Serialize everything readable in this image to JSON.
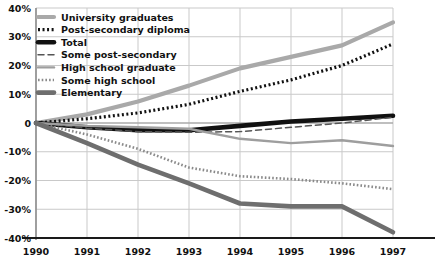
{
  "chart_data": {
    "type": "line",
    "title": "",
    "subtitle": "",
    "xlabel": "",
    "ylabel": "",
    "x": [
      1990,
      1991,
      1992,
      1993,
      1994,
      1995,
      1996,
      1997
    ],
    "xtick_labels": [
      "1990",
      "1991",
      "1992",
      "1993",
      "1994",
      "1995",
      "1996",
      "1997"
    ],
    "ytick_labels": [
      "40%",
      "30%",
      "20%",
      "10%",
      "0",
      "-10%",
      "-20%",
      "-30%",
      "-40%"
    ],
    "ytick_values": [
      40,
      30,
      20,
      10,
      0,
      -10,
      -20,
      -30,
      -40
    ],
    "ylim": [
      -40,
      40
    ],
    "xlim": [
      1990,
      1997
    ],
    "grid": true,
    "legend_position": "top-left",
    "series": [
      {
        "name": "University graduates",
        "values": [
          0,
          3,
          7.5,
          13,
          19,
          23,
          27,
          35
        ],
        "color": "#a9a9a9",
        "style": "solid",
        "width": 4.2
      },
      {
        "name": "Post-secondary diploma",
        "values": [
          0,
          1.5,
          3.5,
          6.5,
          11,
          15,
          20,
          27.5
        ],
        "color": "#111111",
        "style": "dotted",
        "width": 3.2
      },
      {
        "name": "Total",
        "values": [
          0,
          -1.5,
          -2.5,
          -2.5,
          -1,
          0.5,
          1.5,
          2.5
        ],
        "color": "#111111",
        "style": "solid",
        "width": 4.6
      },
      {
        "name": "Some post-secondary",
        "values": [
          0,
          -1.8,
          -3.0,
          -3.2,
          -3.0,
          -1.5,
          0.0,
          2.0
        ],
        "color": "#555555",
        "style": "dashed",
        "width": 1.5
      },
      {
        "name": "High school graduate",
        "values": [
          0,
          -1.0,
          -1.5,
          -2.0,
          -5.5,
          -7.0,
          -6.0,
          -8.0
        ],
        "color": "#9e9e9e",
        "style": "solid",
        "width": 2.4
      },
      {
        "name": "Some high school",
        "values": [
          0,
          -4.0,
          -9.0,
          -15.5,
          -18.5,
          -19.5,
          -21.0,
          -23.0
        ],
        "color": "#8a8a8a",
        "style": "dotted",
        "width": 2.6
      },
      {
        "name": "Elementary",
        "values": [
          0,
          -7.0,
          -14.5,
          -21.0,
          -28.0,
          -29.0,
          -29.0,
          -38.0
        ],
        "color": "#6e6e6e",
        "style": "solid",
        "width": 4.6
      }
    ]
  },
  "legend": {
    "items": [
      {
        "label": "University graduates"
      },
      {
        "label": "Post-secondary diploma"
      },
      {
        "label": "Total"
      },
      {
        "label": "Some post-secondary"
      },
      {
        "label": "High school graduate"
      },
      {
        "label": "Some high school"
      },
      {
        "label": "Elementary"
      }
    ]
  },
  "axes": {
    "grid_color": "#c9c9c9",
    "axis_color": "#1a1a1a"
  }
}
